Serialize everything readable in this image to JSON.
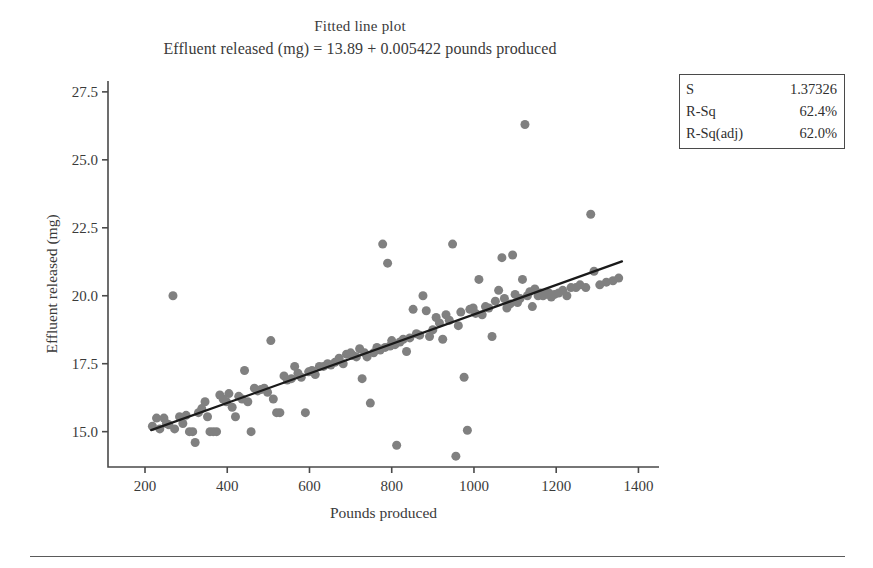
{
  "figure": {
    "title": "Fitted line plot",
    "subtitle": "Effluent released (mg) = 13.89 + 0.005422 pounds produced"
  },
  "stats_box": {
    "rows": [
      {
        "label": "S",
        "value": "1.37326"
      },
      {
        "label": "R-Sq",
        "value": "62.4%"
      },
      {
        "label": "R-Sq(adj)",
        "value": "62.0%"
      }
    ]
  },
  "colors": {
    "marker": "#808080",
    "fit_line": "#1a1a1a",
    "axis": "#4a4a4a",
    "text": "#3a3a3a",
    "background": "#ffffff"
  },
  "chart_data": {
    "type": "scatter",
    "title": "Fitted line plot",
    "subtitle": "Effluent released (mg) = 13.89 + 0.005422 pounds produced",
    "xlabel": "Pounds produced",
    "ylabel": "Effluent released (mg)",
    "xlim": [
      110,
      1450
    ],
    "ylim": [
      13.7,
      27.9
    ],
    "xticks": [
      200,
      400,
      600,
      800,
      1000,
      1200,
      1400
    ],
    "yticks": [
      15.0,
      17.5,
      20.0,
      22.5,
      25.0,
      27.5
    ],
    "grid": false,
    "legend": false,
    "marker": {
      "shape": "circle",
      "color": "#808080",
      "size": 9
    },
    "fit_line": {
      "label": "Effluent released (mg) = 13.89 + 0.005422 pounds produced",
      "intercept": 13.89,
      "slope": 0.005422,
      "x_start": 215,
      "x_end": 1360,
      "color": "#1a1a1a",
      "width": 2.2
    },
    "statistics": {
      "S": 1.37326,
      "R_Sq": "62.4%",
      "R_Sq_adj": "62.0%"
    },
    "points": [
      [
        218,
        15.2
      ],
      [
        228,
        15.5
      ],
      [
        236,
        15.1
      ],
      [
        246,
        15.5
      ],
      [
        252,
        15.3
      ],
      [
        258,
        15.25
      ],
      [
        268,
        20.0
      ],
      [
        272,
        15.1
      ],
      [
        284,
        15.55
      ],
      [
        292,
        15.3
      ],
      [
        300,
        15.6
      ],
      [
        308,
        15.0
      ],
      [
        316,
        15.0
      ],
      [
        322,
        14.6
      ],
      [
        330,
        15.7
      ],
      [
        338,
        15.85
      ],
      [
        346,
        16.1
      ],
      [
        352,
        15.55
      ],
      [
        358,
        15.0
      ],
      [
        366,
        15.0
      ],
      [
        374,
        15.0
      ],
      [
        382,
        16.35
      ],
      [
        390,
        16.2
      ],
      [
        398,
        16.1
      ],
      [
        404,
        16.4
      ],
      [
        412,
        15.9
      ],
      [
        420,
        15.55
      ],
      [
        428,
        16.3
      ],
      [
        436,
        16.2
      ],
      [
        442,
        17.25
      ],
      [
        450,
        16.1
      ],
      [
        458,
        15.0
      ],
      [
        466,
        16.6
      ],
      [
        474,
        16.5
      ],
      [
        482,
        16.55
      ],
      [
        490,
        16.6
      ],
      [
        498,
        16.45
      ],
      [
        506,
        18.35
      ],
      [
        512,
        16.2
      ],
      [
        520,
        15.7
      ],
      [
        528,
        15.7
      ],
      [
        538,
        17.05
      ],
      [
        546,
        16.9
      ],
      [
        556,
        16.95
      ],
      [
        564,
        17.4
      ],
      [
        572,
        17.15
      ],
      [
        580,
        17.0
      ],
      [
        590,
        15.7
      ],
      [
        598,
        17.2
      ],
      [
        606,
        17.25
      ],
      [
        614,
        17.1
      ],
      [
        624,
        17.4
      ],
      [
        634,
        17.4
      ],
      [
        644,
        17.5
      ],
      [
        652,
        17.45
      ],
      [
        662,
        17.55
      ],
      [
        672,
        17.7
      ],
      [
        682,
        17.5
      ],
      [
        690,
        17.85
      ],
      [
        700,
        17.9
      ],
      [
        706,
        17.8
      ],
      [
        714,
        17.75
      ],
      [
        722,
        18.05
      ],
      [
        728,
        16.95
      ],
      [
        734,
        17.9
      ],
      [
        740,
        17.75
      ],
      [
        748,
        16.05
      ],
      [
        756,
        17.9
      ],
      [
        764,
        18.1
      ],
      [
        772,
        18.0
      ],
      [
        778,
        21.9
      ],
      [
        784,
        18.1
      ],
      [
        790,
        21.2
      ],
      [
        796,
        18.15
      ],
      [
        800,
        18.35
      ],
      [
        808,
        18.2
      ],
      [
        812,
        14.5
      ],
      [
        820,
        18.3
      ],
      [
        828,
        18.4
      ],
      [
        836,
        17.95
      ],
      [
        844,
        18.45
      ],
      [
        852,
        19.5
      ],
      [
        860,
        18.6
      ],
      [
        868,
        18.55
      ],
      [
        876,
        20.0
      ],
      [
        884,
        19.45
      ],
      [
        892,
        18.5
      ],
      [
        900,
        18.75
      ],
      [
        908,
        19.2
      ],
      [
        916,
        19.0
      ],
      [
        924,
        18.4
      ],
      [
        932,
        19.3
      ],
      [
        940,
        19.1
      ],
      [
        948,
        21.9
      ],
      [
        956,
        14.1
      ],
      [
        962,
        18.9
      ],
      [
        968,
        19.4
      ],
      [
        976,
        17.0
      ],
      [
        984,
        15.05
      ],
      [
        990,
        19.5
      ],
      [
        998,
        19.55
      ],
      [
        1004,
        19.35
      ],
      [
        1012,
        20.6
      ],
      [
        1020,
        19.3
      ],
      [
        1028,
        19.6
      ],
      [
        1036,
        19.55
      ],
      [
        1044,
        18.5
      ],
      [
        1052,
        19.8
      ],
      [
        1060,
        20.2
      ],
      [
        1068,
        21.4
      ],
      [
        1074,
        19.9
      ],
      [
        1080,
        19.55
      ],
      [
        1088,
        19.7
      ],
      [
        1094,
        21.5
      ],
      [
        1100,
        20.05
      ],
      [
        1106,
        19.75
      ],
      [
        1112,
        19.9
      ],
      [
        1118,
        20.6
      ],
      [
        1124,
        26.3
      ],
      [
        1130,
        20.0
      ],
      [
        1136,
        20.15
      ],
      [
        1142,
        19.6
      ],
      [
        1148,
        20.25
      ],
      [
        1156,
        20.0
      ],
      [
        1162,
        20.1
      ],
      [
        1168,
        20.0
      ],
      [
        1174,
        20.05
      ],
      [
        1182,
        20.1
      ],
      [
        1188,
        19.95
      ],
      [
        1196,
        20.05
      ],
      [
        1206,
        20.1
      ],
      [
        1216,
        20.2
      ],
      [
        1226,
        20.0
      ],
      [
        1236,
        20.3
      ],
      [
        1248,
        20.3
      ],
      [
        1258,
        20.4
      ],
      [
        1272,
        20.3
      ],
      [
        1284,
        23.0
      ],
      [
        1292,
        20.9
      ],
      [
        1306,
        20.4
      ],
      [
        1322,
        20.5
      ],
      [
        1338,
        20.55
      ],
      [
        1352,
        20.65
      ]
    ]
  }
}
